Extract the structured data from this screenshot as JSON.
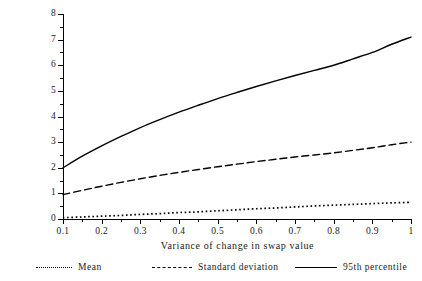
{
  "chart_data": {
    "type": "line",
    "title": "",
    "xlabel": "Variance of change in swap value",
    "ylabel_line1": "Change in net exposure",
    "ylabel_line2": "(as % of notional princip",
    "xlim": [
      0.1,
      1.0
    ],
    "ylim": [
      0,
      8
    ],
    "grid": false,
    "legend_position": "bottom",
    "x_ticks": [
      "0.1",
      "0.2",
      "0.3",
      "0.4",
      "0.5",
      "0.6",
      "0.7",
      "0.8",
      "0.9",
      "1"
    ],
    "x_tick_values": [
      0.1,
      0.2,
      0.3,
      0.4,
      0.5,
      0.6,
      0.7,
      0.8,
      0.9,
      1.0
    ],
    "y_ticks": [
      "0",
      "1",
      "2",
      "3",
      "4",
      "5",
      "6",
      "7",
      "8"
    ],
    "y_tick_values": [
      0,
      1,
      2,
      3,
      4,
      5,
      6,
      7,
      8
    ],
    "x": [
      0.1,
      0.15,
      0.2,
      0.25,
      0.3,
      0.35,
      0.4,
      0.45,
      0.5,
      0.55,
      0.6,
      0.65,
      0.7,
      0.75,
      0.8,
      0.85,
      0.9,
      0.95,
      1.0
    ],
    "series": [
      {
        "name": "Mean",
        "style": "dotted",
        "color": "#000000",
        "values": [
          0.05,
          0.08,
          0.11,
          0.14,
          0.18,
          0.21,
          0.25,
          0.28,
          0.32,
          0.36,
          0.4,
          0.43,
          0.47,
          0.51,
          0.54,
          0.57,
          0.6,
          0.63,
          0.65
        ]
      },
      {
        "name": "Standard deviation",
        "style": "dashed",
        "color": "#000000",
        "values": [
          0.95,
          1.12,
          1.28,
          1.43,
          1.57,
          1.7,
          1.82,
          1.93,
          2.04,
          2.14,
          2.24,
          2.33,
          2.42,
          2.5,
          2.58,
          2.68,
          2.78,
          2.9,
          3.0
        ]
      },
      {
        "name": "95th percentile",
        "style": "solid",
        "color": "#000000",
        "values": [
          2.0,
          2.45,
          2.85,
          3.22,
          3.57,
          3.88,
          4.17,
          4.44,
          4.7,
          4.94,
          5.17,
          5.39,
          5.6,
          5.8,
          6.0,
          6.25,
          6.5,
          6.82,
          7.1
        ]
      }
    ]
  },
  "legend": {
    "items": [
      {
        "label": "Mean",
        "style": "dotted"
      },
      {
        "label": "Standard deviation",
        "style": "dashed"
      },
      {
        "label": "95th percentile",
        "style": "solid"
      }
    ]
  },
  "axis": {
    "x_title": "Variance of change in swap value",
    "y_title_line1": "Change in net exposure",
    "y_title_line2": "(as % of notional princip"
  }
}
